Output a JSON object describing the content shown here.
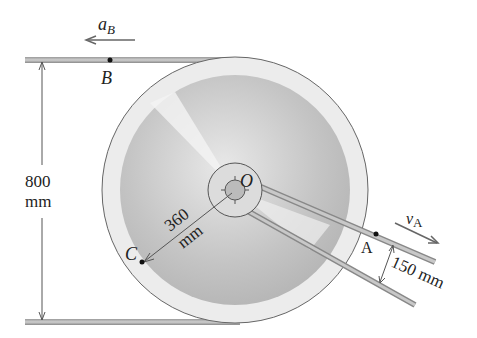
{
  "diagram": {
    "labels": {
      "aB_main": "a",
      "aB_sub": "B",
      "B": "B",
      "O": "O",
      "C": "C",
      "A": "A",
      "vA_main": "v",
      "vA_sub": "A",
      "dim_800_value": "800",
      "dim_800_unit": "mm",
      "dim_360_value": "360",
      "dim_360_unit": "mm",
      "dim_150": "150 mm"
    },
    "colors": {
      "bar": "#b8b8b8",
      "disk_rim": "#e6e6e6",
      "disk_face": "#c8c8c8",
      "line": "#555555"
    }
  }
}
